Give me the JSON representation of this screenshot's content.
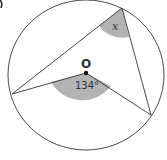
{
  "diagram": {
    "center_label": "O",
    "central_angle_label": "134°",
    "unknown_angle_label": "x",
    "colors": {
      "line": "#333333",
      "shade": "#b3b3b3",
      "background": "#ffffff"
    },
    "points": {
      "top": [
        122,
        8
      ],
      "left": [
        12,
        94
      ],
      "right": [
        151,
        115
      ],
      "center": [
        86,
        73
      ]
    }
  }
}
